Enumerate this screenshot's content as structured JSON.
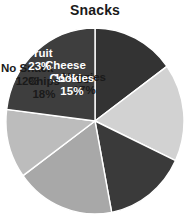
{
  "chart_data": {
    "type": "pie",
    "title": "Snacks",
    "xlabel": "",
    "ylabel": "",
    "legend": "none",
    "grid": false,
    "units": "percent",
    "start_angle_deg": 0,
    "direction": "clockwise",
    "categories": [
      "Cheese",
      "Veggies",
      "Cookies",
      "Chips",
      "No Snack",
      "Fruit"
    ],
    "values": [
      15,
      17,
      15,
      18,
      12,
      23
    ],
    "slices": [
      {
        "label": "Cheese",
        "value": 15,
        "value_text": "15%",
        "color": "#333333",
        "text_color": "#ffffff",
        "label_x": 60.5,
        "label_y": 45.0
      },
      {
        "label": "Veggies",
        "value": 17,
        "value_text": "17%",
        "color": "#d2d2d2",
        "text_color": "#1a1a1a",
        "label_x": 79.0,
        "label_y": 57.0
      },
      {
        "label": "Cookies",
        "value": 15,
        "value_text": "15%",
        "color": "#3a3a3a",
        "text_color": "#ffffff",
        "label_x": 67.0,
        "label_y": 58.0
      },
      {
        "label": "Chips",
        "value": 18,
        "value_text": "18%",
        "color": "#a8a8a8",
        "text_color": "#1a1a1a",
        "label_x": 39.0,
        "label_y": 61.0
      },
      {
        "label": "No Snack",
        "value": 12,
        "value_text": "12%",
        "color": "#bcbcbc",
        "text_color": "#1a1a1a",
        "label_x": 22.0,
        "label_y": 48.0
      },
      {
        "label": "Fruit",
        "value": 23,
        "value_text": "23%",
        "color": "#3e3e3e",
        "text_color": "#ffffff",
        "label_x": 35.0,
        "label_y": 33.0
      }
    ],
    "total": 100
  }
}
